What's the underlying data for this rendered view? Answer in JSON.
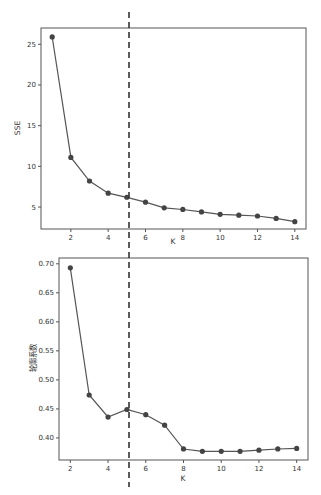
{
  "chart_data": [
    {
      "type": "line",
      "title": "",
      "xlabel": "K",
      "ylabel": "SSE",
      "x": [
        1,
        2,
        3,
        4,
        5,
        6,
        7,
        8,
        9,
        10,
        11,
        12,
        13,
        14
      ],
      "series": [
        {
          "name": "SSE",
          "values": [
            25.9,
            11.1,
            8.2,
            6.7,
            6.2,
            5.6,
            4.9,
            4.7,
            4.4,
            4.1,
            4.0,
            3.9,
            3.6,
            3.2
          ]
        }
      ],
      "xticks": [
        2,
        4,
        6,
        8,
        10,
        12,
        14
      ],
      "yticks": [
        5,
        10,
        15,
        20,
        25
      ],
      "xlim": [
        0.4,
        14.6
      ],
      "ylim": [
        2.3,
        27.0
      ],
      "grid": false,
      "vline": {
        "x": 5,
        "style": "dashed"
      }
    },
    {
      "type": "line",
      "title": "",
      "xlabel": "K",
      "ylabel": "轮廓系数",
      "x": [
        2,
        3,
        4,
        5,
        6,
        7,
        8,
        9,
        10,
        11,
        12,
        13,
        14
      ],
      "series": [
        {
          "name": "轮廓系数",
          "values": [
            0.693,
            0.474,
            0.436,
            0.449,
            0.44,
            0.422,
            0.381,
            0.377,
            0.377,
            0.377,
            0.379,
            0.381,
            0.382
          ]
        }
      ],
      "xticks": [
        2,
        4,
        6,
        8,
        10,
        12,
        14
      ],
      "yticks": [
        0.4,
        0.45,
        0.5,
        0.55,
        0.6,
        0.65,
        0.7
      ],
      "xlim": [
        1.4,
        14.6
      ],
      "ylim": [
        0.362,
        0.71
      ],
      "grid": false,
      "vline": {
        "x": 5,
        "style": "dashed"
      }
    }
  ],
  "charts": {
    "top": {
      "xlabel": "K",
      "ylabel": "SSE",
      "xtick_labels": [
        "2",
        "4",
        "6",
        "8",
        "10",
        "12",
        "14"
      ],
      "ytick_labels": [
        "5",
        "10",
        "15",
        "20",
        "25"
      ]
    },
    "bottom": {
      "xlabel": "K",
      "ylabel": "轮廓系数",
      "xtick_labels": [
        "2",
        "4",
        "6",
        "8",
        "10",
        "12",
        "14"
      ],
      "ytick_labels": [
        "0.40",
        "0.45",
        "0.50",
        "0.55",
        "0.60",
        "0.65",
        "0.70"
      ]
    }
  },
  "colors": {
    "line": "#555555",
    "marker": "#444444",
    "axes": "#555555",
    "vline": "#333333"
  }
}
